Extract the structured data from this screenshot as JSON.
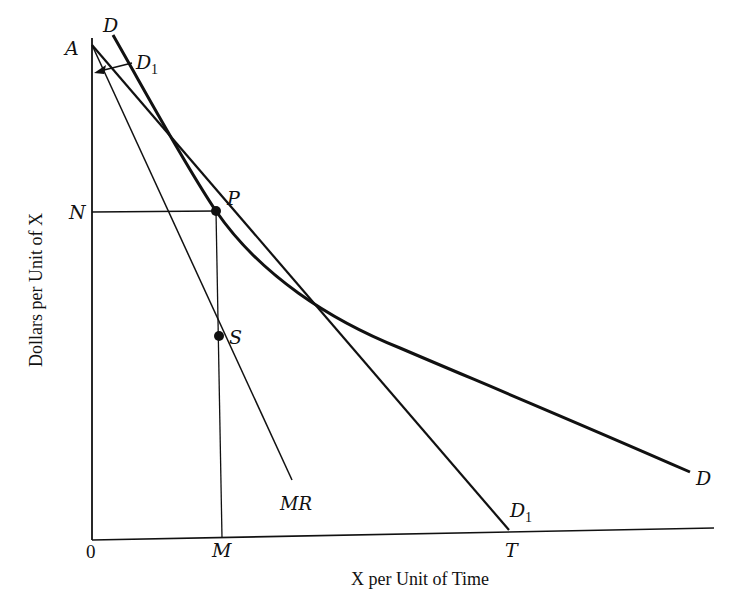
{
  "diagram": {
    "type": "economics-demand-marginal-revenue",
    "axes": {
      "x_label": "X per Unit of Time",
      "y_label": "Dollars per Unit of X",
      "origin_label": "0"
    },
    "points": {
      "A": "A",
      "P": "P",
      "S": "S",
      "N": "N",
      "M": "M",
      "T": "T"
    },
    "curves": {
      "demand_curve": "D",
      "demand_curve_end": "D",
      "tangent_line": "D",
      "tangent_sub": "1",
      "tangent_line_end": "D",
      "tangent_end_sub": "1",
      "marginal_revenue": "MR"
    },
    "colors": {
      "ink": "#111111",
      "background": "#ffffff"
    }
  }
}
